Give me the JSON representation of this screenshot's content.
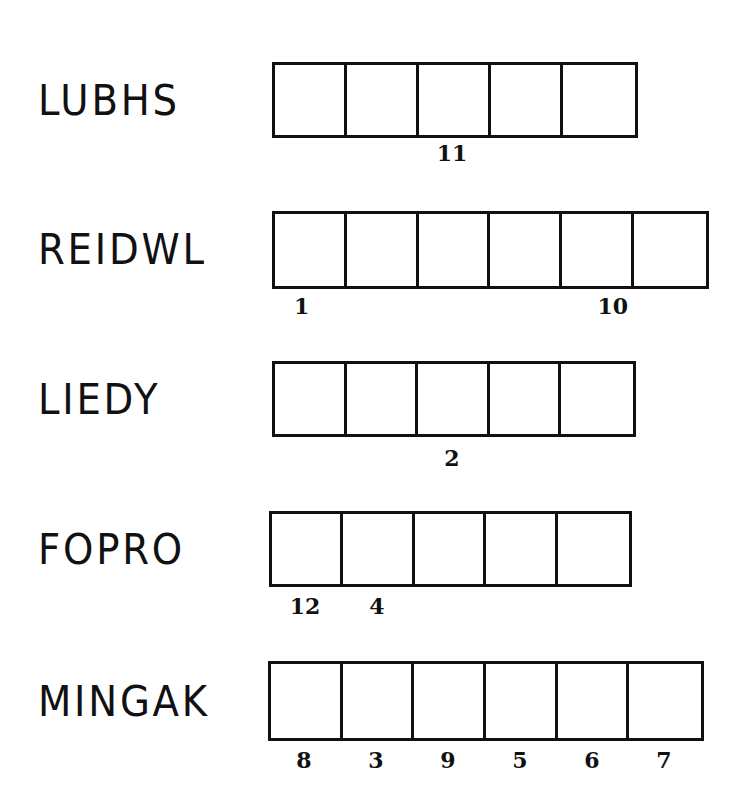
{
  "puzzle": {
    "type": "word-jumble",
    "rows": [
      {
        "scrambled": "LUBHS",
        "boxes": 5,
        "numbers": [
          "",
          "",
          "11",
          "",
          ""
        ]
      },
      {
        "scrambled": "REIDWL",
        "boxes": 6,
        "numbers": [
          "1",
          "",
          "",
          "",
          "10",
          ""
        ]
      },
      {
        "scrambled": "LIEDY",
        "boxes": 5,
        "numbers": [
          "",
          "",
          "2",
          "",
          ""
        ]
      },
      {
        "scrambled": "FOPRO",
        "boxes": 5,
        "numbers": [
          "12",
          "4",
          "",
          "",
          ""
        ]
      },
      {
        "scrambled": "MINGAK",
        "boxes": 6,
        "numbers": [
          "8",
          "3",
          "9",
          "5",
          "6",
          "7"
        ]
      }
    ]
  }
}
